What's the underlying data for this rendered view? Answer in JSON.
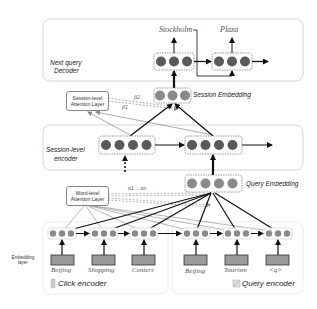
{
  "decoder": {
    "title_line1": "Next query",
    "title_line2": "Decoder",
    "outputs": [
      "Stockholm",
      "Plaza"
    ]
  },
  "session_embedding": {
    "label": "Session Embedding"
  },
  "session_attention": {
    "line1": "Session-level",
    "line2": "Attention Layer",
    "weights": [
      "β2",
      "β1"
    ]
  },
  "session_encoder": {
    "title_line1": "Session-level",
    "title_line2": "encoder"
  },
  "query_embedding": {
    "label": "Query Embedding"
  },
  "word_attention": {
    "line1": "Word-level",
    "line2": "Attention Layer",
    "weights": "α1 ... αn"
  },
  "embedding_layer": {
    "line1": "Embedding",
    "line2": "layer"
  },
  "click_encoder": {
    "label": "Click encoder",
    "words": [
      "Beijing",
      "Shopping",
      "Centers"
    ]
  },
  "query_encoder": {
    "label": "Query encoder",
    "words": [
      "Beijing",
      "Tourism",
      "<q>"
    ]
  },
  "colors": {
    "circle_dark": "#5a5a5a",
    "circle_light": "#8a8a8a",
    "embed_rect": "#9a9a9a",
    "box_border": "#cfcfcf",
    "arrow": "#111111",
    "thin_line": "#888888"
  }
}
